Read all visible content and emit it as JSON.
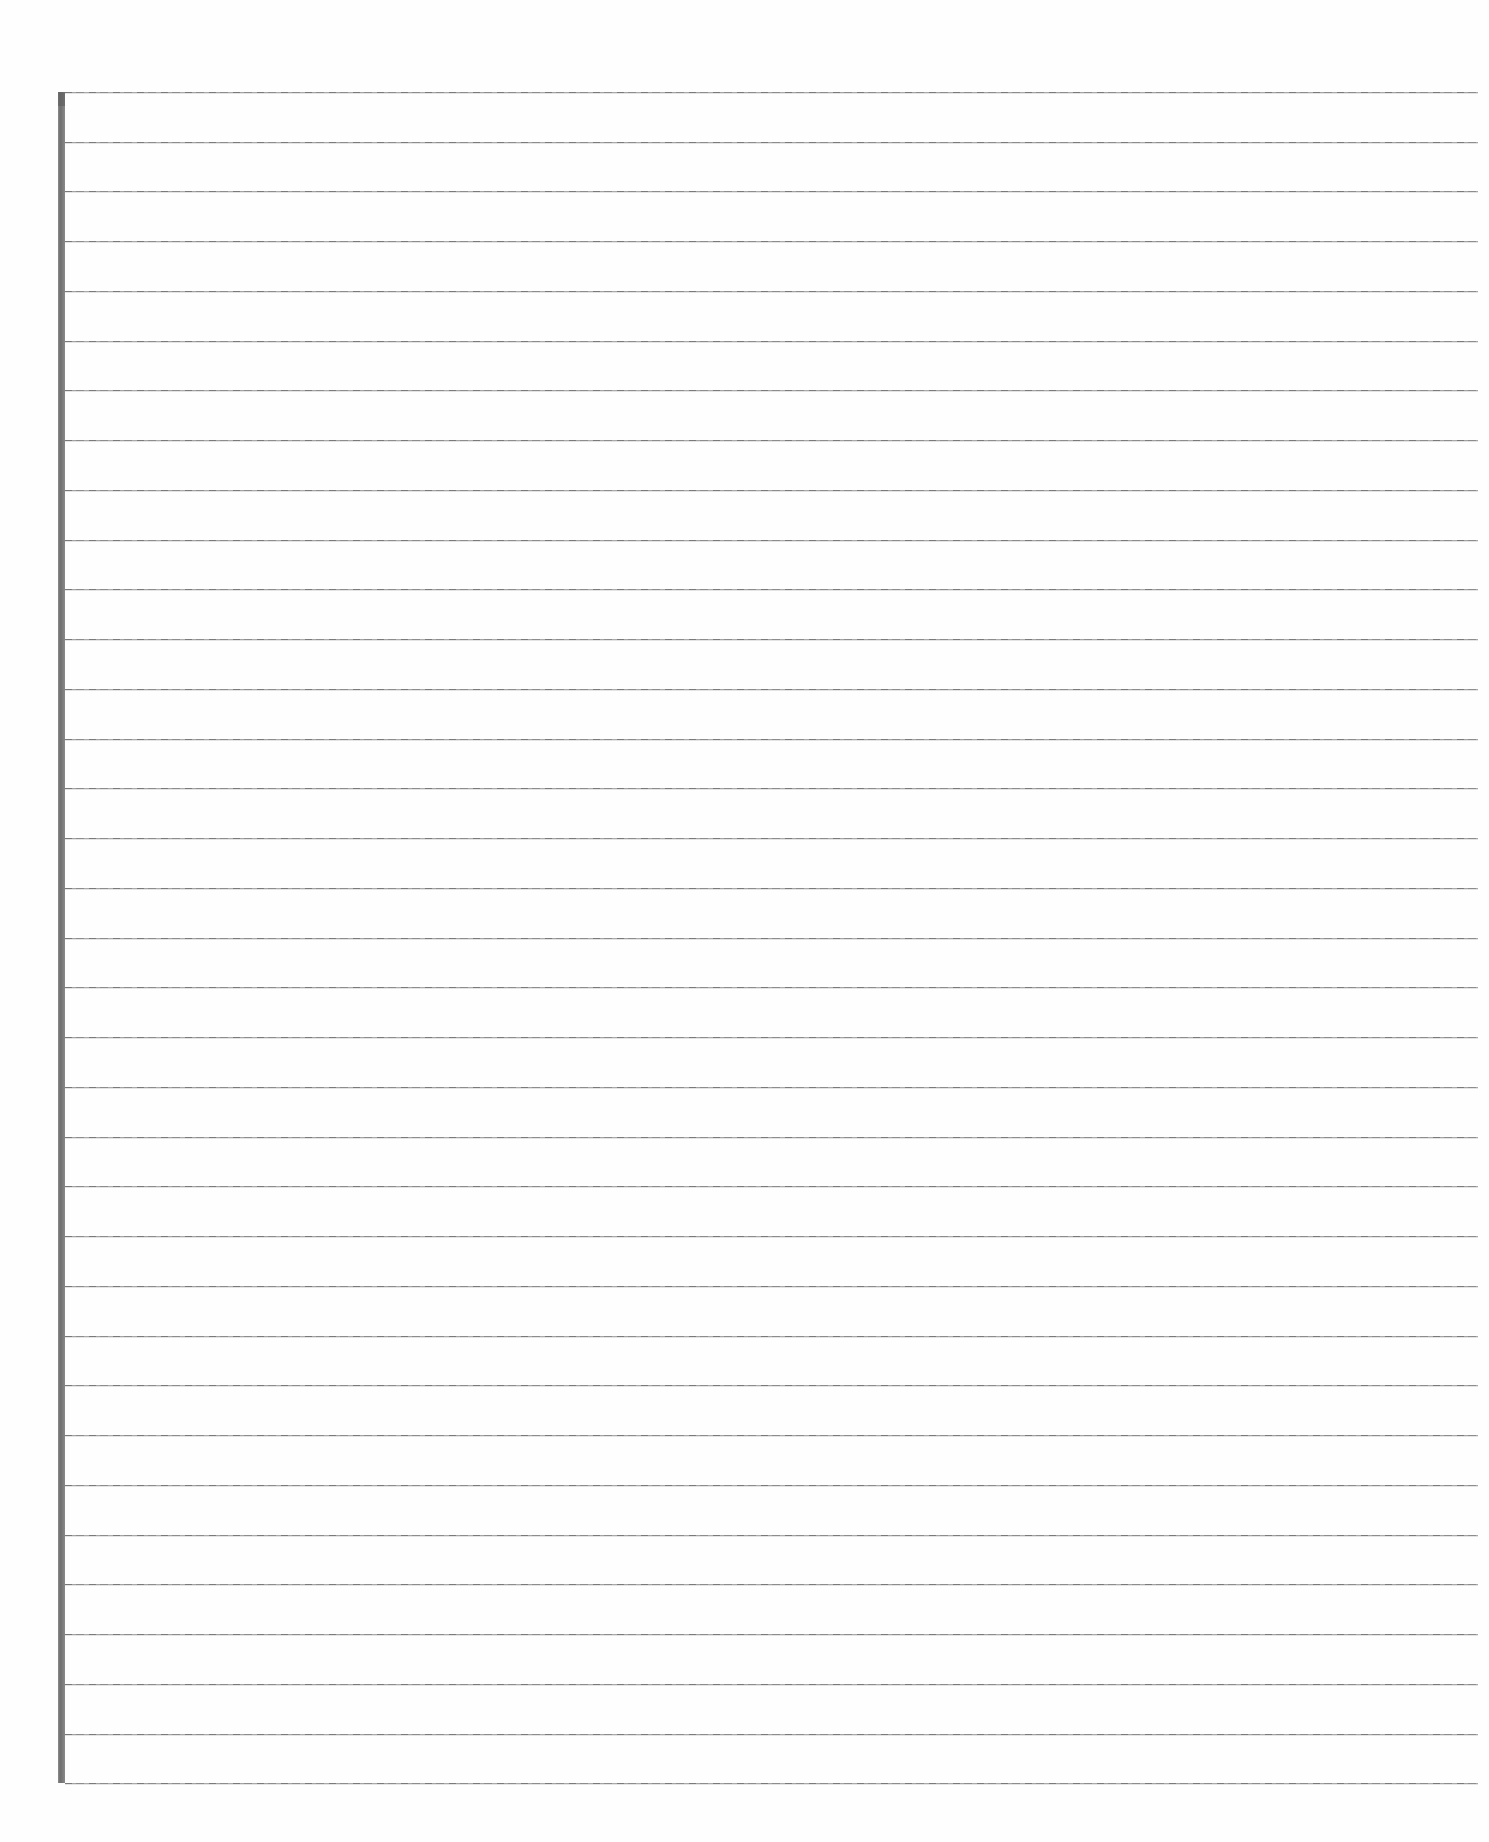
{
  "document": {
    "kind": "lined-notebook-paper",
    "title": "Blank Ruled Paper Sheet",
    "written_content": "",
    "page_width": 1489,
    "page_height": 1842,
    "background_color": "#ffffff"
  },
  "margin_rule": {
    "name": "vertical-margin-line",
    "color": "#7d7d7d",
    "x": 58,
    "width": 7,
    "top": 92,
    "bottom": 1783
  },
  "ruling": {
    "name": "horizontal-ruled-lines",
    "color": "#9d9d9d",
    "line_count": 35,
    "first_line_y": 92,
    "line_spacing": 49.74,
    "line_left": 65,
    "line_right": 1478,
    "line_thickness": 1
  },
  "writing_lines": [
    {
      "index": 1,
      "y": 92,
      "text": ""
    },
    {
      "index": 2,
      "y": 142,
      "text": ""
    },
    {
      "index": 3,
      "y": 191,
      "text": ""
    },
    {
      "index": 4,
      "y": 241,
      "text": ""
    },
    {
      "index": 5,
      "y": 291,
      "text": ""
    },
    {
      "index": 6,
      "y": 341,
      "text": ""
    },
    {
      "index": 7,
      "y": 390,
      "text": ""
    },
    {
      "index": 8,
      "y": 440,
      "text": ""
    },
    {
      "index": 9,
      "y": 490,
      "text": ""
    },
    {
      "index": 10,
      "y": 540,
      "text": ""
    },
    {
      "index": 11,
      "y": 589,
      "text": ""
    },
    {
      "index": 12,
      "y": 639,
      "text": ""
    },
    {
      "index": 13,
      "y": 689,
      "text": ""
    },
    {
      "index": 14,
      "y": 739,
      "text": ""
    },
    {
      "index": 15,
      "y": 788,
      "text": ""
    },
    {
      "index": 16,
      "y": 838,
      "text": ""
    },
    {
      "index": 17,
      "y": 888,
      "text": ""
    },
    {
      "index": 18,
      "y": 938,
      "text": ""
    },
    {
      "index": 19,
      "y": 987,
      "text": ""
    },
    {
      "index": 20,
      "y": 1037,
      "text": ""
    },
    {
      "index": 21,
      "y": 1087,
      "text": ""
    },
    {
      "index": 22,
      "y": 1137,
      "text": ""
    },
    {
      "index": 23,
      "y": 1186,
      "text": ""
    },
    {
      "index": 24,
      "y": 1236,
      "text": ""
    },
    {
      "index": 25,
      "y": 1286,
      "text": ""
    },
    {
      "index": 26,
      "y": 1336,
      "text": ""
    },
    {
      "index": 27,
      "y": 1385,
      "text": ""
    },
    {
      "index": 28,
      "y": 1435,
      "text": ""
    },
    {
      "index": 29,
      "y": 1485,
      "text": ""
    },
    {
      "index": 30,
      "y": 1535,
      "text": ""
    },
    {
      "index": 31,
      "y": 1584,
      "text": ""
    },
    {
      "index": 32,
      "y": 1634,
      "text": ""
    },
    {
      "index": 33,
      "y": 1684,
      "text": ""
    },
    {
      "index": 34,
      "y": 1734,
      "text": ""
    },
    {
      "index": 35,
      "y": 1783,
      "text": ""
    }
  ]
}
